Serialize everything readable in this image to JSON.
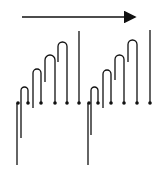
{
  "diagram": {
    "stroke_color": "#111111",
    "background": "#ffffff",
    "arrow": {
      "x1": 22,
      "x2": 137,
      "y": 17,
      "direction": "right"
    },
    "baseline_y": 103,
    "groups": [
      {
        "long_line": {
          "x": 17,
          "y1": 103,
          "y2": 165
        },
        "hooks": [
          {
            "left_x": 21,
            "right_x": 28,
            "top_y": 87,
            "left_bottom": 138
          },
          {
            "left_x": 33,
            "right_x": 41,
            "top_y": 69,
            "left_bottom": 108
          },
          {
            "left_x": 45,
            "right_x": 55,
            "top_y": 55,
            "left_bottom": 82
          },
          {
            "left_x": 58,
            "right_x": 67,
            "top_y": 42,
            "left_bottom": 62
          }
        ],
        "tall_line": {
          "x": 79,
          "y1": 31,
          "y2": 103
        }
      },
      {
        "long_line": {
          "x": 88,
          "y1": 103,
          "y2": 165
        },
        "hooks": [
          {
            "left_x": 91,
            "right_x": 98,
            "top_y": 87,
            "left_bottom": 135
          },
          {
            "left_x": 103,
            "right_x": 111,
            "top_y": 70,
            "left_bottom": 108
          },
          {
            "left_x": 115,
            "right_x": 124,
            "top_y": 55,
            "left_bottom": 80
          },
          {
            "left_x": 128,
            "right_x": 137,
            "top_y": 40,
            "left_bottom": 62
          }
        ],
        "tall_line": {
          "x": 150,
          "y1": 30,
          "y2": 103
        }
      }
    ]
  }
}
